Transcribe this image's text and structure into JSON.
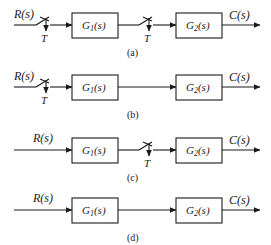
{
  "diagram": {
    "type": "sampled-data block diagrams",
    "colors": {
      "stroke": "#1a1a1a",
      "background": "#ffffff"
    },
    "rows": [
      {
        "id": "a",
        "caption": "(a)",
        "input_label": "R(s)",
        "output_label": "C(s)",
        "block1": {
          "name": "G",
          "sub": "1",
          "arg": "(s)"
        },
        "block2": {
          "name": "G",
          "sub": "2",
          "arg": "(s)"
        },
        "samplers": [
          {
            "position": "input",
            "label": "T"
          },
          {
            "position": "between-blocks",
            "label": "T"
          }
        ]
      },
      {
        "id": "b",
        "caption": "(b)",
        "input_label": "R(s)",
        "output_label": "C(s)",
        "block1": {
          "name": "G",
          "sub": "1",
          "arg": "(s)"
        },
        "block2": {
          "name": "G",
          "sub": "2",
          "arg": "(s)"
        },
        "samplers": [
          {
            "position": "input",
            "label": "T"
          }
        ]
      },
      {
        "id": "c",
        "caption": "(c)",
        "input_label": "R(s)",
        "output_label": "C(s)",
        "block1": {
          "name": "G",
          "sub": "1",
          "arg": "(s)"
        },
        "block2": {
          "name": "G",
          "sub": "2",
          "arg": "(s)"
        },
        "samplers": [
          {
            "position": "between-blocks",
            "label": "T"
          }
        ]
      },
      {
        "id": "d",
        "caption": "(d)",
        "input_label": "R(s)",
        "output_label": "C(s)",
        "block1": {
          "name": "G",
          "sub": "1",
          "arg": "(s)"
        },
        "block2": {
          "name": "G",
          "sub": "2",
          "arg": "(s)"
        },
        "samplers": []
      }
    ]
  }
}
